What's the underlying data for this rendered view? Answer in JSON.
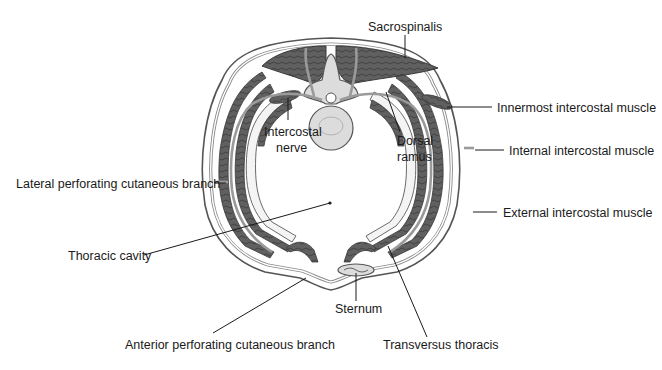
{
  "figure": {
    "colors": {
      "background": "#ffffff",
      "muscle": "#5e5e5e",
      "bone": "#dcdcdc",
      "outline": "#555555",
      "label_text": "#1a1a1a"
    },
    "labels": {
      "sacrospinalis": "Sacrospinalis",
      "intercostal_nerve_line1": "Intercostal",
      "intercostal_nerve_line2": "nerve",
      "dorsal_ramus_line1": "Dorsal",
      "dorsal_ramus_line2": "ramus",
      "innermost_intercostal": "Innermost intercostal muscle",
      "internal_intercostal": "Internal intercostal muscle",
      "lateral_perforating": "Lateral perforating cutaneous branch",
      "external_intercostal": "External intercostal muscle",
      "thoracic_cavity": "Thoracic cavity",
      "sternum": "Sternum",
      "anterior_perforating": "Anterior perforating cutaneous branch",
      "transversus_thoracis": "Transversus thoracis"
    }
  }
}
